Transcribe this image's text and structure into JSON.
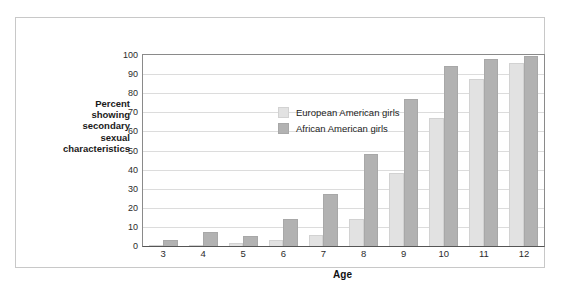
{
  "chart_data": {
    "type": "bar",
    "title": "",
    "xlabel": "Age",
    "ylabel": "Percent showing secondary sexual characteristics",
    "ylabel_lines": [
      "Percent",
      "showing",
      "secondary",
      "sexual",
      "characteristics"
    ],
    "categories": [
      "3",
      "4",
      "5",
      "6",
      "7",
      "8",
      "9",
      "10",
      "11",
      "12"
    ],
    "ylim": [
      0,
      100
    ],
    "ytick_values": [
      0,
      10,
      20,
      30,
      40,
      50,
      60,
      70,
      80,
      90,
      100
    ],
    "ytick_labels": [
      "0",
      "10",
      "20",
      "30",
      "40",
      "50",
      "60",
      "70",
      "80",
      "90",
      "100"
    ],
    "grid": true,
    "grid_axis": "y",
    "legend_position": "top-left-inside",
    "series": [
      {
        "name": "European American girls",
        "color": "#e2e2e2",
        "values": [
          0.5,
          0.3,
          1.5,
          3,
          6,
          14,
          38,
          67,
          87.5,
          96
        ]
      },
      {
        "name": "African American girls",
        "color": "#b2b2b2",
        "values": [
          3,
          7.5,
          5.5,
          14,
          27,
          48,
          77,
          94,
          98,
          99.5
        ]
      }
    ]
  },
  "colors": {
    "european_american": "#e2e2e2",
    "african_american": "#b2b2b2",
    "gridline": "#dcdcdc",
    "axis": "#555555",
    "frame_border": "#c8c8c8",
    "text": "#222222",
    "background": "#ffffff"
  }
}
